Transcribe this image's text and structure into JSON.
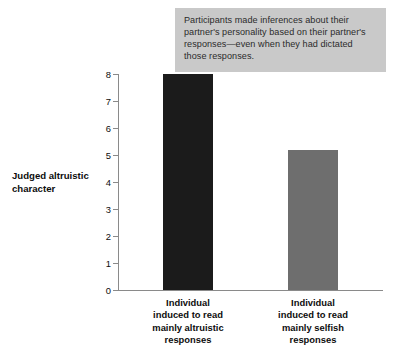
{
  "annotation": {
    "text": "Participants made inferences about their partner's personality based on their partner's responses—even when they had dictated those responses.",
    "background_color": "#c9c9c9",
    "text_color": "#2b2b2b"
  },
  "chart_data": {
    "type": "bar",
    "title": "",
    "subtitle": "",
    "xlabel": "",
    "ylabel": "Judged altruistic\ncharacter",
    "ylim": [
      0,
      8
    ],
    "ytick_labels": [
      "0",
      "1",
      "2",
      "3",
      "4",
      "5",
      "6",
      "7",
      "8"
    ],
    "ytick_values": [
      0,
      1,
      2,
      3,
      4,
      5,
      6,
      7,
      8
    ],
    "grid": false,
    "legend": false,
    "categories": [
      "Individual\ninduced to read\nmainly altruistic\nresponses",
      "Individual\ninduced to read\nmainly selfish\nresponses"
    ],
    "values": [
      8.0,
      5.2
    ],
    "bar_colors": [
      "#1b1b1b",
      "#6e6e6e"
    ],
    "axis_color": "#8a8a8a",
    "background_color": "#ffffff"
  }
}
